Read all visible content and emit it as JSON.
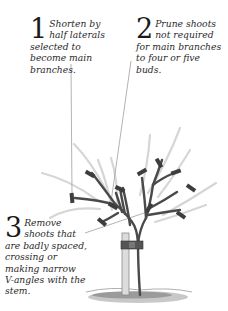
{
  "annotations": [
    {
      "number": "1",
      "text": "Shorten by half laterals selected to become main branches."
    },
    {
      "number": "2",
      "text": "Prune shoots not required for main branches to four or five buds."
    },
    {
      "number": "3",
      "text": "Remove shoots that are badly spaced, crossing or making narrow V-angles with the stem."
    }
  ],
  "illustration": {
    "subject": "young-tree-pruning",
    "elements": [
      "tree-trunk",
      "stake",
      "tree-tie",
      "ground",
      "pruned-branches",
      "removed-shoots"
    ],
    "colors": {
      "branch": "#4a4a4a",
      "cut_mark": "#3a3a3a",
      "removed_shoot": "#d4d4d4",
      "leader_line": "#9a9a9a",
      "stake": "#cfcfcf",
      "ground": "#8a8a8a"
    }
  }
}
